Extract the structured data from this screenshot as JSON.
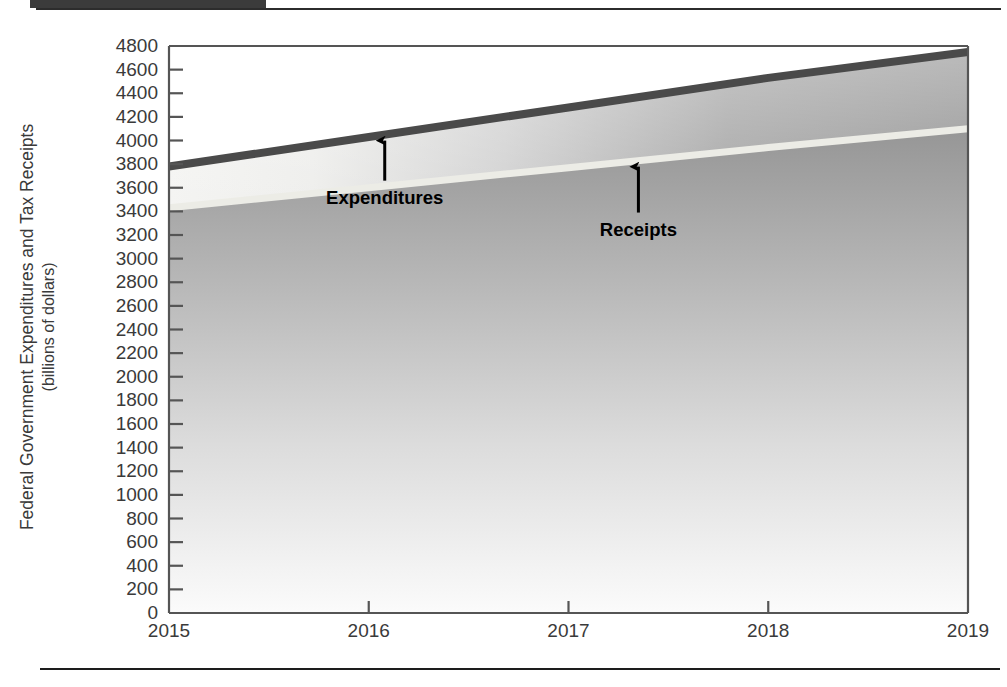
{
  "figure": {
    "y_axis_title_line1": "Federal Government Expenditures and Tax Receipts",
    "y_axis_title_line2": "(billions of dollars)",
    "annotations": [
      {
        "name": "expenditures",
        "label": "Expenditures"
      },
      {
        "name": "receipts",
        "label": "Receipts"
      }
    ]
  },
  "chart_data": {
    "type": "area",
    "title": "",
    "subtitle": "",
    "xlabel": "",
    "ylabel": "Federal Government Expenditures and Tax Receipts (billions of dollars)",
    "x": [
      2015,
      2016,
      2017,
      2018,
      2019
    ],
    "xlim": [
      2015,
      2019
    ],
    "ylim": [
      0,
      4800
    ],
    "ytick_step": 200,
    "xtick_labels": [
      "2015",
      "2016",
      "2017",
      "2018",
      "2019"
    ],
    "ytick_labels": [
      "4800",
      "4600",
      "4400",
      "4200",
      "4000",
      "3800",
      "3600",
      "3400",
      "3200",
      "3000",
      "2800",
      "2600",
      "2400",
      "2200",
      "2000",
      "1800",
      "1600",
      "1400",
      "1200",
      "1000",
      "800",
      "600",
      "400",
      "200",
      "0"
    ],
    "grid": false,
    "legend_position": "inline-annotations",
    "series": [
      {
        "name": "Expenditures",
        "values": [
          3780,
          4030,
          4280,
          4530,
          4750
        ],
        "color": "#4a4a4a",
        "style": "thick-line"
      },
      {
        "name": "Receipts",
        "values": [
          3430,
          3600,
          3770,
          3940,
          4100
        ],
        "color": "#e8e8e2",
        "style": "thick-line"
      }
    ],
    "annotations": [
      {
        "text": "Expenditures",
        "x": 2016.08,
        "y": 3990
      },
      {
        "text": "Receipts",
        "x": 2017.35,
        "y": 3840
      }
    ],
    "colors": {
      "expenditures_line": "#4a4a4a",
      "receipts_line": "#e8e8e2",
      "fill_top": "#9a9a9a",
      "fill_bottom": "#f7f7f7",
      "axis": "#555555",
      "text": "#3a3a3a",
      "annotation_text": "#000000"
    }
  }
}
